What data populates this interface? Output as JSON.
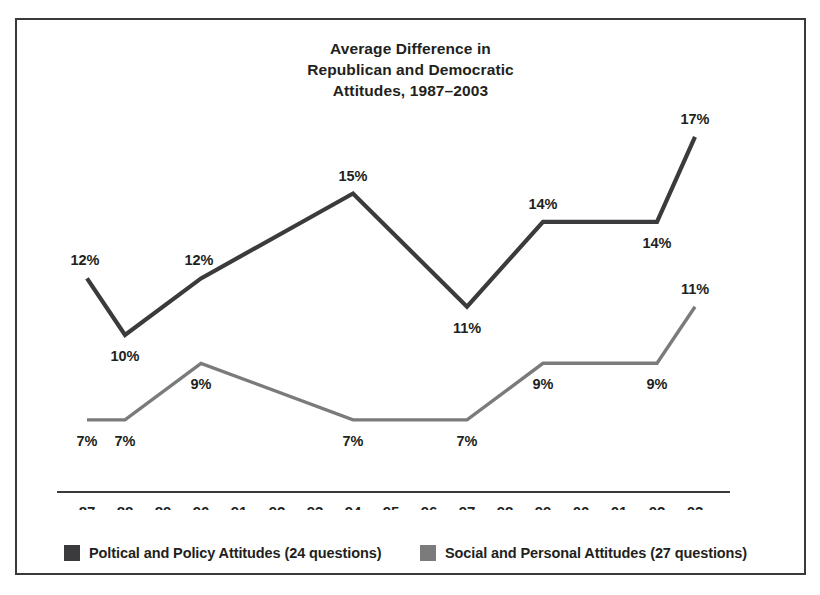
{
  "title": {
    "lines": [
      "Average Difference in",
      "Republican and Democratic",
      "Attitudes, 1987–2003"
    ]
  },
  "colors": {
    "series_dark": "#3b3a3c",
    "series_gray": "#7b7b7b",
    "axis": "#3a3a3a",
    "frame": "#3a3a3a",
    "text": "#231f20",
    "background": "#ffffff"
  },
  "legend": {
    "position": "bottom-left",
    "entries": [
      {
        "label": "Poltical and Policy Attitudes (24 questions)",
        "color": "#3b3a3c"
      },
      {
        "label": "Social and Personal Attitudes (27 questions)",
        "color": "#7b7b7b"
      }
    ]
  },
  "chart_data": {
    "type": "line",
    "xlabel": "",
    "ylabel": "",
    "grid": false,
    "legend_position": "bottom",
    "categories": [
      "87",
      "88",
      "89",
      "90",
      "91",
      "92",
      "93",
      "94",
      "95",
      "96",
      "97",
      "98",
      "99",
      "00",
      "01",
      "02",
      "03"
    ],
    "ylim": [
      5,
      18
    ],
    "series": [
      {
        "name": "Poltical and Policy Attitudes (24 questions)",
        "color": "#3b3a3c",
        "unit": "%",
        "points": [
          {
            "x": "87",
            "value": 12,
            "label": "12%",
            "label_pos": "above-left"
          },
          {
            "x": "88",
            "value": 10,
            "label": "10%",
            "label_pos": "below"
          },
          {
            "x": "90",
            "value": 12,
            "label": "12%",
            "label_pos": "above-left"
          },
          {
            "x": "94",
            "value": 15,
            "label": "15%",
            "label_pos": "above"
          },
          {
            "x": "97",
            "value": 11,
            "label": "11%",
            "label_pos": "below"
          },
          {
            "x": "99",
            "value": 14,
            "label": "14%",
            "label_pos": "above"
          },
          {
            "x": "02",
            "value": 14,
            "label": "14%",
            "label_pos": "below"
          },
          {
            "x": "03",
            "value": 17,
            "label": "17%",
            "label_pos": "above"
          }
        ]
      },
      {
        "name": "Social and Personal Attitudes (27 questions)",
        "color": "#7b7b7b",
        "unit": "%",
        "points": [
          {
            "x": "87",
            "value": 7,
            "label": "7%",
            "label_pos": "below"
          },
          {
            "x": "88",
            "value": 7,
            "label": "7%",
            "label_pos": "below"
          },
          {
            "x": "90",
            "value": 9,
            "label": "9%",
            "label_pos": "below"
          },
          {
            "x": "94",
            "value": 7,
            "label": "7%",
            "label_pos": "below"
          },
          {
            "x": "97",
            "value": 7,
            "label": "7%",
            "label_pos": "below"
          },
          {
            "x": "99",
            "value": 9,
            "label": "9%",
            "label_pos": "below"
          },
          {
            "x": "02",
            "value": 9,
            "label": "9%",
            "label_pos": "below"
          },
          {
            "x": "03",
            "value": 11,
            "label": "11%",
            "label_pos": "above"
          }
        ]
      }
    ]
  },
  "plot_geometry": {
    "x_start": 70,
    "x_step": 38,
    "axis_y": 472,
    "axis_x_left": 40,
    "axis_x_right": 713,
    "tick_label_y": 497,
    "value_for_y": 10,
    "y_at_value": 315,
    "px_per_unit": 28.3,
    "line_width_dark": 4.2,
    "line_width_gray": 3.4
  }
}
